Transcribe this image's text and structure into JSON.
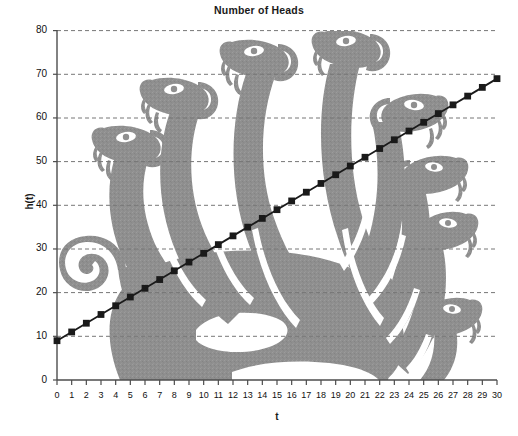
{
  "chart_data": {
    "type": "line",
    "title": "Number of Heads",
    "xlabel": "t",
    "ylabel": "h(t)",
    "x": [
      0,
      1,
      2,
      3,
      4,
      5,
      6,
      7,
      8,
      9,
      10,
      11,
      12,
      13,
      14,
      15,
      16,
      17,
      18,
      19,
      20,
      21,
      22,
      23,
      24,
      25,
      26,
      27,
      28,
      29,
      30
    ],
    "values": [
      9,
      11,
      13,
      15,
      17,
      19,
      21,
      23,
      25,
      27,
      29,
      31,
      33,
      35,
      37,
      39,
      41,
      43,
      45,
      47,
      49,
      51,
      53,
      55,
      57,
      59,
      61,
      63,
      65,
      67,
      69
    ],
    "series": [
      {
        "name": "h(t)",
        "values": [
          9,
          11,
          13,
          15,
          17,
          19,
          21,
          23,
          25,
          27,
          29,
          31,
          33,
          35,
          37,
          39,
          41,
          43,
          45,
          47,
          49,
          51,
          53,
          55,
          57,
          59,
          61,
          63,
          65,
          67,
          69
        ]
      }
    ],
    "xlim": [
      0,
      30
    ],
    "ylim": [
      0,
      80
    ],
    "xticks": [
      0,
      1,
      2,
      3,
      4,
      5,
      6,
      7,
      8,
      9,
      10,
      11,
      12,
      13,
      14,
      15,
      16,
      17,
      18,
      19,
      20,
      21,
      22,
      23,
      24,
      25,
      26,
      27,
      28,
      29,
      30
    ],
    "yticks": [
      0,
      10,
      20,
      30,
      40,
      50,
      60,
      70,
      80
    ],
    "xtick_labels": [
      "0",
      "1",
      "2",
      "3",
      "4",
      "5",
      "6",
      "7",
      "8",
      "9",
      "10",
      "11",
      "12",
      "13",
      "14",
      "15",
      "16",
      "17",
      "18",
      "19",
      "20",
      "21",
      "22",
      "23",
      "24",
      "25",
      "26",
      "27",
      "28",
      "29",
      "30"
    ],
    "ytick_labels": [
      "0",
      "10",
      "20",
      "30",
      "40",
      "50",
      "60",
      "70",
      "80"
    ],
    "grid": "horizontal-dashed",
    "legend": "none",
    "marker": "square",
    "line_color": "#1a1a1a",
    "marker_color": "#1a1a1a",
    "grid_color": "#8a8a8a",
    "axis_color": "#555555",
    "background_color": "#ffffff",
    "background_image": "hydra-silhouette",
    "background_image_color": "#8f8f8f",
    "background_image_description": "Gray silhouette of a many-headed hydra with serpent heads filling the plot area"
  }
}
